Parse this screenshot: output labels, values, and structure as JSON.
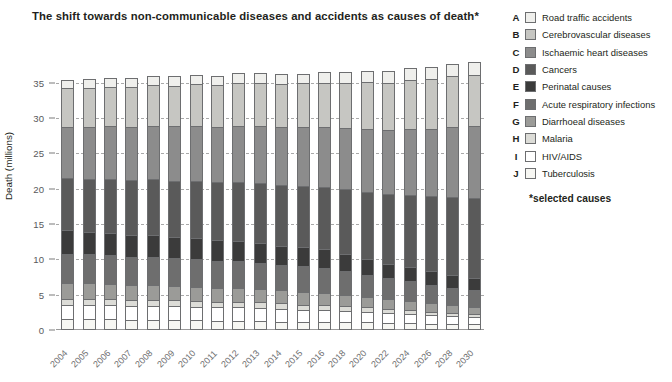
{
  "chart_data": {
    "type": "bar",
    "stacked": true,
    "title": "The shift towards non-communicable diseases and accidents as causes of death*",
    "xlabel": "",
    "ylabel": "Death (millions)",
    "ylim": [
      0,
      36.5
    ],
    "yticks": [
      0,
      5,
      10,
      15,
      20,
      25,
      30,
      35
    ],
    "grid": true,
    "legend_position": "right",
    "note": "*selected causes",
    "categories": [
      "2004",
      "2005",
      "2006",
      "2007",
      "2008",
      "2009",
      "2010",
      "2011",
      "2012",
      "2013",
      "2014",
      "2015",
      "2016",
      "2018",
      "2020",
      "2022",
      "2024",
      "2026",
      "2028",
      "2030"
    ],
    "series": [
      {
        "key": "J",
        "name": "Tuberculosis",
        "color": "#f7f7f3",
        "values": [
          1.5,
          1.5,
          1.5,
          1.4,
          1.4,
          1.4,
          1.4,
          1.3,
          1.3,
          1.3,
          1.2,
          1.2,
          1.2,
          1.1,
          1.1,
          1.0,
          1.0,
          0.9,
          0.9,
          0.8
        ]
      },
      {
        "key": "I",
        "name": "HIV/AIDS",
        "color": "#ffffff",
        "values": [
          2.0,
          2.0,
          2.0,
          2.0,
          2.0,
          2.0,
          1.9,
          1.9,
          1.9,
          1.8,
          1.8,
          1.7,
          1.7,
          1.6,
          1.5,
          1.4,
          1.3,
          1.2,
          1.1,
          1.0
        ]
      },
      {
        "key": "H",
        "name": "Malaria",
        "color": "#dcdcd7",
        "values": [
          0.9,
          0.9,
          0.9,
          0.9,
          0.9,
          0.9,
          0.8,
          0.8,
          0.8,
          0.8,
          0.8,
          0.7,
          0.7,
          0.7,
          0.6,
          0.6,
          0.5,
          0.5,
          0.4,
          0.4
        ]
      },
      {
        "key": "G",
        "name": "Diarrhoeal diseases",
        "color": "#9b9b98",
        "values": [
          2.2,
          2.2,
          2.1,
          2.1,
          2.1,
          2.0,
          2.0,
          2.0,
          1.9,
          1.9,
          1.8,
          1.8,
          1.7,
          1.6,
          1.5,
          1.4,
          1.3,
          1.2,
          1.1,
          1.0
        ]
      },
      {
        "key": "F",
        "name": "Acute respiratory infections",
        "color": "#6e6e6e",
        "values": [
          4.2,
          4.1,
          4.1,
          4.0,
          4.0,
          3.9,
          3.9,
          3.8,
          3.8,
          3.7,
          3.6,
          3.6,
          3.5,
          3.3,
          3.1,
          2.9,
          2.8,
          2.6,
          2.5,
          2.4
        ]
      },
      {
        "key": "E",
        "name": "Perinatal causes",
        "color": "#3b3b3b",
        "values": [
          3.3,
          3.2,
          3.2,
          3.1,
          3.1,
          3.0,
          3.0,
          2.9,
          2.9,
          2.8,
          2.7,
          2.7,
          2.6,
          2.4,
          2.3,
          2.1,
          2.0,
          1.9,
          1.8,
          1.7
        ]
      },
      {
        "key": "D",
        "name": "Cancers",
        "color": "#5a5a5a",
        "values": [
          7.4,
          7.5,
          7.6,
          7.7,
          7.8,
          7.9,
          8.1,
          8.2,
          8.3,
          8.5,
          8.6,
          8.7,
          8.9,
          9.2,
          9.5,
          9.8,
          10.2,
          10.6,
          11.0,
          11.4
        ]
      },
      {
        "key": "C",
        "name": "Ischaemic heart diseases",
        "color": "#8c8c8c",
        "values": [
          7.2,
          7.3,
          7.4,
          7.5,
          7.6,
          7.7,
          7.8,
          7.9,
          8.0,
          8.1,
          8.2,
          8.3,
          8.4,
          8.7,
          8.9,
          9.1,
          9.4,
          9.6,
          9.9,
          10.1
        ]
      },
      {
        "key": "B",
        "name": "Cerebrovascular diseases",
        "color": "#c6c6c2",
        "values": [
          5.5,
          5.6,
          5.6,
          5.7,
          5.7,
          5.8,
          5.9,
          5.9,
          6.0,
          6.1,
          6.1,
          6.2,
          6.3,
          6.4,
          6.6,
          6.7,
          6.9,
          7.0,
          7.2,
          7.3
        ]
      },
      {
        "key": "A",
        "name": "Road traffic accidents",
        "color": "#efefec",
        "values": [
          1.2,
          1.2,
          1.2,
          1.2,
          1.3,
          1.3,
          1.3,
          1.3,
          1.4,
          1.4,
          1.4,
          1.4,
          1.5,
          1.5,
          1.6,
          1.6,
          1.7,
          1.7,
          1.8,
          1.8
        ]
      }
    ]
  },
  "legend": {
    "items": [
      {
        "key": "A",
        "label": "Road traffic accidents",
        "color": "#efefec"
      },
      {
        "key": "B",
        "label": "Cerebrovascular diseases",
        "color": "#c6c6c2"
      },
      {
        "key": "C",
        "label": "Ischaemic heart diseases",
        "color": "#8c8c8c"
      },
      {
        "key": "D",
        "label": "Cancers",
        "color": "#5a5a5a"
      },
      {
        "key": "E",
        "label": "Perinatal causes",
        "color": "#3b3b3b"
      },
      {
        "key": "F",
        "label": "Acute respiratory infections",
        "color": "#6e6e6e"
      },
      {
        "key": "G",
        "label": "Diarrhoeal diseases",
        "color": "#9b9b98"
      },
      {
        "key": "H",
        "label": "Malaria",
        "color": "#dcdcd7"
      },
      {
        "key": "I",
        "label": "HIV/AIDS",
        "color": "#ffffff"
      },
      {
        "key": "J",
        "label": "Tuberculosis",
        "color": "#f7f7f3"
      }
    ],
    "note": "*selected causes"
  }
}
